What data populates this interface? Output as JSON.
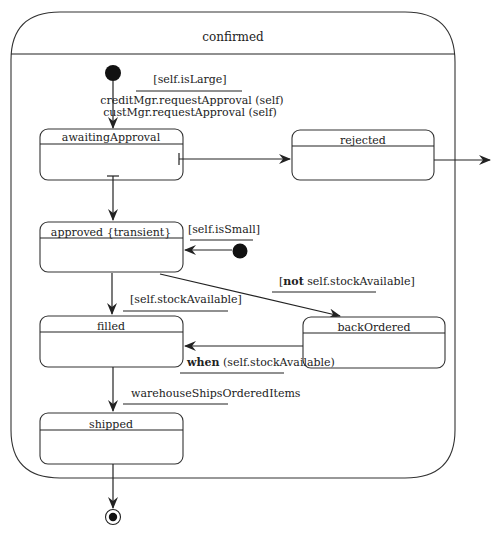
{
  "diagram": {
    "type": "UML state machine",
    "composite_state": {
      "name": "confirmed"
    },
    "states": [
      {
        "id": "awaitingApproval",
        "name": "awaitingApproval"
      },
      {
        "id": "rejected",
        "name": "rejected"
      },
      {
        "id": "approved",
        "name": "approved {transient}"
      },
      {
        "id": "filled",
        "name": "filled"
      },
      {
        "id": "backOrdered",
        "name": "backOrdered"
      },
      {
        "id": "shipped",
        "name": "shipped"
      }
    ],
    "transitions": {
      "initial_to_awaiting": {
        "guard": "[self.isLarge]",
        "action_line1": "creditMgr.requestApproval (self)",
        "action_line2": "custMgr.requestApproval (self)"
      },
      "initial_to_approved": {
        "guard": "[self.isSmall]"
      },
      "approved_to_backordered": {
        "guard_open": "[",
        "guard_keyword": "not",
        "guard_rest": " self.stockAvailable]"
      },
      "approved_to_filled": {
        "guard": "[self.stockAvailable]"
      },
      "backordered_to_filled": {
        "keyword": "when",
        "condition": " (self.stockAvailable)"
      },
      "filled_to_shipped": {
        "event": "warehouseShipsOrderedItems"
      }
    },
    "colors": {
      "line": "#222222",
      "background": "#ffffff"
    }
  }
}
